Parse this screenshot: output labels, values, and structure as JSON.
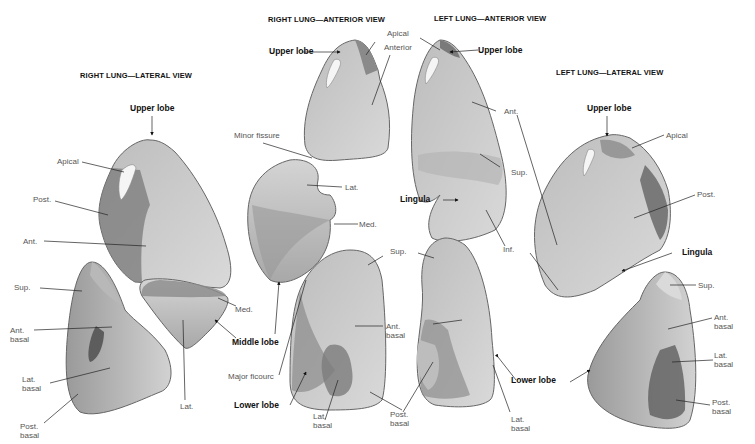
{
  "titles": {
    "right_lateral": "RIGHT LUNG—LATERAL VIEW",
    "right_anterior": "RIGHT LUNG—ANTERIOR VIEW",
    "left_anterior": "LEFT LUNG—ANTERIOR VIEW",
    "left_lateral": "LEFT LUNG—LATERAL VIEW"
  },
  "right_lateral": {
    "upper_lobe": "Upper lobe",
    "apical": "Apical",
    "post": "Post.",
    "ant": "Ant.",
    "sup": "Sup.",
    "ant_basal": "Ant.\nbasal",
    "lat_basal": "Lat.\nbasal",
    "post_basal": "Post.\nbasal",
    "med": "Med.",
    "lat": "Lat."
  },
  "right_anterior": {
    "upper_lobe": "Upper lobe",
    "apical": "Apical",
    "anterior": "Anterior",
    "minor_fissure": "Minor fissure",
    "lat": "Lat.",
    "med": "Med.",
    "middle_lobe": "Middle lobe",
    "major_fissure": "Major ficourc",
    "lower_lobe": "Lower lobe",
    "sup": "Sup.",
    "ant_basal": "Ant.\nbasal",
    "lat_basal": "Lat.\nbasal",
    "post_basal": "Post.\nbasal"
  },
  "left_anterior": {
    "upper_lobe": "Upper lobe",
    "ant": "Ant.",
    "sup": "Sup.",
    "lingula": "Lingula",
    "inf": "Inf.",
    "sup_lower": "Sup.",
    "ant_basal": "Ant.\nbasal",
    "post_basal": "Post.\nbasal",
    "lat_basal": "Lat.\nbasal",
    "lower_lobe": "Lower lobe"
  },
  "left_lateral": {
    "upper_lobe": "Upper lobe",
    "apical": "Apical",
    "post": "Post.",
    "lingula": "Lingula",
    "sup": "Sup.",
    "ant_basal": "Ant.\nbasal",
    "lat_basal": "Lat.\nbasal",
    "post_basal": "Post.\nbasal",
    "lower_lobe": "Lower lobe"
  },
  "colors": {
    "lung_light": "#cfcfcf",
    "lung_mid": "#a9a9a9",
    "lung_dark": "#6e6e6e",
    "outline": "#555555",
    "leader": "#222222"
  }
}
